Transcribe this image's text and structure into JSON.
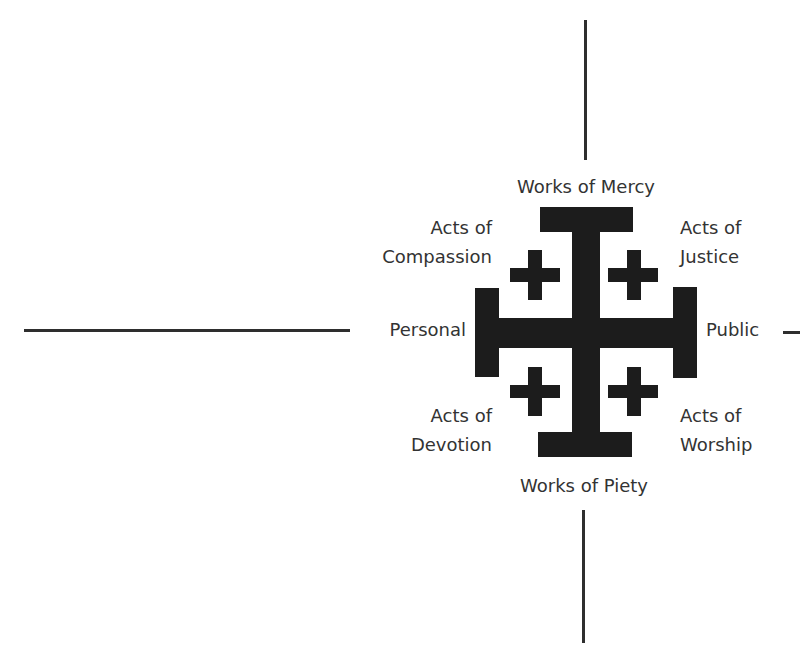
{
  "diagram": {
    "axes": {
      "vertical_top_label": "Works of Mercy",
      "vertical_bottom_label": "Works of Piety",
      "horizontal_left_label": "Personal",
      "horizontal_right_label": "Public"
    },
    "quadrants": {
      "top_left": {
        "line1": "Acts of",
        "line2": "Compassion"
      },
      "top_right": {
        "line1": "Acts of",
        "line2": "Justice"
      },
      "bottom_left": {
        "line1": "Acts of",
        "line2": "Devotion"
      },
      "bottom_right": {
        "line1": "Acts of",
        "line2": "Worship"
      }
    },
    "symbol": "jerusalem-cross-icon",
    "colors": {
      "cross": "#1c1c1c",
      "text": "#333333",
      "axis": "#2e2e2e",
      "background": "#ffffff"
    }
  }
}
